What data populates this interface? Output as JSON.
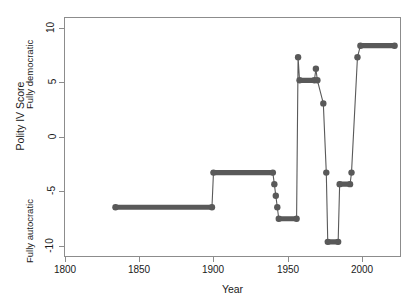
{
  "chart_data": {
    "type": "line",
    "title": "",
    "subtitle": "",
    "xlabel": "Year",
    "ylabel": "Polity IV Score",
    "xlim": [
      1789,
      2016
    ],
    "ylim": [
      -10.4,
      10.4
    ],
    "xticks": [
      1800,
      1850,
      1900,
      1950,
      2000
    ],
    "xticklabels": [
      "1800",
      "1850",
      "1900",
      "1950",
      "2000"
    ],
    "yticks": [
      10,
      5,
      0,
      -5,
      -10
    ],
    "yticklabels": [
      "10",
      "5",
      "0",
      "-5",
      "-10"
    ],
    "grid": false,
    "legend": null,
    "annotations": [
      {
        "text": "Fully democratic",
        "axis": "y",
        "value": 7.5,
        "rotation": -90
      },
      {
        "text": "Fully autocratic",
        "axis": "y",
        "value": -6.5,
        "rotation": -90
      }
    ],
    "series": [
      {
        "name": "Polity IV Score",
        "color": "#595959",
        "linewidth": 1.1,
        "marker": "circle",
        "markersize": 3.2,
        "drawstyle": "steps-post",
        "x": [
          1823,
          1888,
          1889,
          1929,
          1930,
          1931,
          1932,
          1933,
          1945,
          1946,
          1947,
          1957,
          1958,
          1959,
          1963,
          1965,
          1966,
          1973,
          1974,
          1981,
          1982,
          1986,
          1988,
          2011
        ],
        "y": [
          -6,
          -6,
          -3,
          -3,
          -4,
          -5,
          -6,
          -7,
          -7,
          7,
          5,
          5,
          6,
          5,
          3,
          -3,
          -9,
          -9,
          -4,
          -4,
          -3,
          7,
          8,
          8
        ]
      }
    ],
    "segments": [
      {
        "x0": 1823,
        "x1": 1888,
        "y": -6
      },
      {
        "x0": 1889,
        "x1": 1929,
        "y": -3
      },
      {
        "x0": 1933,
        "x1": 1945,
        "y": -7
      },
      {
        "x0": 1947,
        "x1": 1957,
        "y": 5
      },
      {
        "x0": 1966,
        "x1": 1973,
        "y": -9
      },
      {
        "x0": 1974,
        "x1": 1981,
        "y": -4
      },
      {
        "x0": 1988,
        "x1": 2011,
        "y": 8
      }
    ],
    "points": [
      {
        "x": 1823,
        "y": -6
      },
      {
        "x": 1888,
        "y": -6
      },
      {
        "x": 1889,
        "y": -3
      },
      {
        "x": 1929,
        "y": -3
      },
      {
        "x": 1930,
        "y": -4
      },
      {
        "x": 1931,
        "y": -5
      },
      {
        "x": 1932,
        "y": -6
      },
      {
        "x": 1933,
        "y": -7
      },
      {
        "x": 1945,
        "y": -7
      },
      {
        "x": 1946,
        "y": 7
      },
      {
        "x": 1947,
        "y": 5
      },
      {
        "x": 1957,
        "y": 5
      },
      {
        "x": 1958,
        "y": 6
      },
      {
        "x": 1959,
        "y": 5
      },
      {
        "x": 1963,
        "y": 3
      },
      {
        "x": 1965,
        "y": -3
      },
      {
        "x": 1966,
        "y": -9
      },
      {
        "x": 1973,
        "y": -9
      },
      {
        "x": 1974,
        "y": -4
      },
      {
        "x": 1981,
        "y": -4
      },
      {
        "x": 1982,
        "y": -3
      },
      {
        "x": 1986,
        "y": 7
      },
      {
        "x": 1988,
        "y": 8
      },
      {
        "x": 2011,
        "y": 8
      }
    ]
  },
  "axis": {
    "x_title": "Year",
    "y_title": "Polity IV Score",
    "pole_high": "Fully democratic",
    "pole_low": "Fully autocratic",
    "xticklabels": [
      "1800",
      "1850",
      "1900",
      "1950",
      "2000"
    ],
    "yticklabels": [
      "10",
      "5",
      "0",
      "-5",
      "-10"
    ]
  },
  "style": {
    "line_color": "#595959",
    "axis_color": "#8c8c8c",
    "text_color": "#1a1a1a",
    "background": "#ffffff"
  }
}
